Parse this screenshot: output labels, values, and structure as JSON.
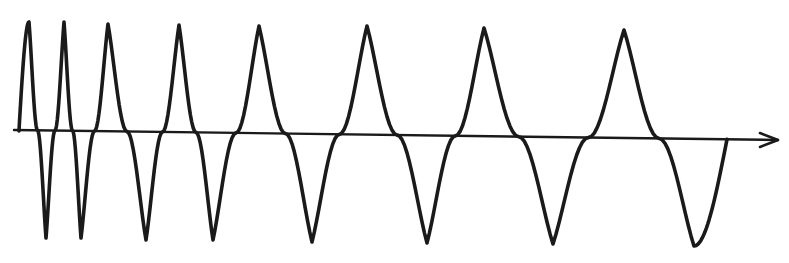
{
  "diagram": {
    "title": "Chirp waveform (decreasing frequency)",
    "colors": {
      "stroke": "#1a1a1a",
      "background": "#ffffff"
    },
    "axis": {
      "start": [
        14,
        130
      ],
      "end": [
        778,
        140
      ],
      "arrowhead": "right"
    },
    "waveform": {
      "start": [
        19,
        131
      ],
      "end": [
        727,
        141
      ],
      "extrema": [
        {
          "type": "peak",
          "x": 29,
          "y": 22
        },
        {
          "type": "trough",
          "x": 46,
          "y": 238
        },
        {
          "type": "peak",
          "x": 64,
          "y": 22
        },
        {
          "type": "trough",
          "x": 81,
          "y": 238
        },
        {
          "type": "peak",
          "x": 108,
          "y": 24
        },
        {
          "type": "trough",
          "x": 146,
          "y": 240
        },
        {
          "type": "peak",
          "x": 179,
          "y": 25
        },
        {
          "type": "trough",
          "x": 213,
          "y": 240
        },
        {
          "type": "peak",
          "x": 259,
          "y": 26
        },
        {
          "type": "trough",
          "x": 312,
          "y": 242
        },
        {
          "type": "peak",
          "x": 367,
          "y": 26
        },
        {
          "type": "trough",
          "x": 427,
          "y": 243
        },
        {
          "type": "peak",
          "x": 484,
          "y": 28
        },
        {
          "type": "trough",
          "x": 553,
          "y": 244
        },
        {
          "type": "peak",
          "x": 624,
          "y": 30
        },
        {
          "type": "trough",
          "x": 694,
          "y": 246
        }
      ]
    }
  }
}
